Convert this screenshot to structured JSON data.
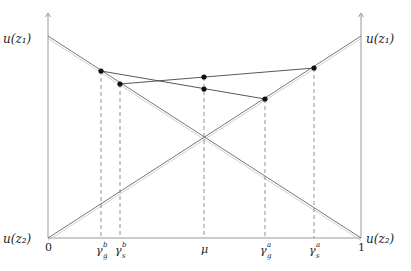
{
  "diagram": {
    "y_axis_labels": {
      "left_top": "u(z₁)",
      "left_bottom": "u(z₂)",
      "right_top": "u(z₁)",
      "right_bottom": "u(z₂)"
    },
    "x_axis_labels": {
      "zero": "0",
      "one": "1",
      "gamma_g_b": {
        "base": "γ",
        "sub": "g",
        "sup": "b"
      },
      "gamma_s_b": {
        "base": "γ",
        "sub": "s",
        "sup": "b"
      },
      "mu": "μ",
      "gamma_g_a": {
        "base": "γ",
        "sub": "g",
        "sup": "a"
      },
      "gamma_s_a": {
        "base": "γ",
        "sub": "s",
        "sup": "a"
      }
    },
    "points": [
      {
        "name": "gamma_g_b_point",
        "x": 101,
        "y": 71
      },
      {
        "name": "gamma_s_b_point",
        "x": 120,
        "y": 84
      },
      {
        "name": "mu_upper_point",
        "x": 204,
        "y": 77
      },
      {
        "name": "mu_lower_point",
        "x": 204,
        "y": 89
      },
      {
        "name": "gamma_g_a_point",
        "x": 265,
        "y": 99
      },
      {
        "name": "gamma_s_a_point",
        "x": 314,
        "y": 68
      }
    ],
    "colors": {
      "line": "#555555",
      "point": "#111111",
      "axis": "#888888"
    }
  }
}
